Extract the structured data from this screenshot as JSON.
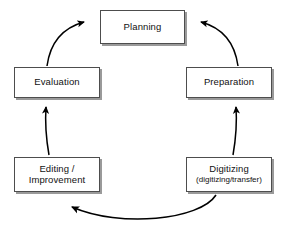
{
  "diagram": {
    "type": "cycle-flowchart",
    "background_color": "#ffffff",
    "node_fill_color": "#ffffff",
    "node_border_color": "#4d4d4d",
    "node_shadow_color": "#9a9a9a",
    "arrow_color": "#000000",
    "nodes": [
      {
        "id": "planning",
        "label": "Planning",
        "sublabel": ""
      },
      {
        "id": "preparation",
        "label": "Preparation",
        "sublabel": ""
      },
      {
        "id": "digitizing",
        "label": "Digitizing",
        "sublabel": "(digitizing/transfer)"
      },
      {
        "id": "editing",
        "label": "Editing /",
        "sublabel": "Improvement"
      },
      {
        "id": "evaluation",
        "label": "Evaluation",
        "sublabel": ""
      }
    ],
    "arrows": [
      {
        "id": "arrow-digitizing-to-editing",
        "from": "digitizing",
        "to": "editing",
        "direction": "left"
      },
      {
        "id": "arrow-editing-to-evaluation",
        "from": "editing",
        "to": "evaluation",
        "direction": "up"
      },
      {
        "id": "arrow-evaluation-to-planning",
        "from": "evaluation",
        "to": "planning",
        "direction": "up-right"
      },
      {
        "id": "arrow-planning-to-preparation",
        "from": "preparation",
        "to": "planning",
        "direction": "up-left"
      },
      {
        "id": "arrow-digitizing-to-preparation",
        "from": "digitizing",
        "to": "preparation",
        "direction": "up"
      }
    ]
  }
}
